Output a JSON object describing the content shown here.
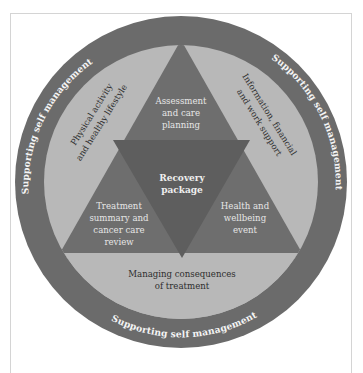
{
  "diagram": {
    "colors": {
      "outer_ring": "#6b6b6b",
      "inner_band": "#b8b8b8",
      "upward_triangle": "#6e6e6e",
      "inverted_triangle": "#5e5e5e",
      "ring_text": "#f4f4f4",
      "band_text": "#2e2e2e",
      "triangle_text": "#e6e6e6",
      "frame_border": "#d4d4d4"
    },
    "outer_ring": {
      "label_top_left": "Supporting self management",
      "label_top_right": "Supporting self management",
      "label_bottom": "Supporting self management"
    },
    "inner_band": {
      "left": [
        "Physical activity",
        "and healthy lifestyle"
      ],
      "right": [
        "Information, financial",
        "and work support"
      ],
      "bottom": [
        "Managing consequences",
        "of treatment"
      ]
    },
    "triangle_segments": {
      "top": [
        "Assessment",
        "and care",
        "planning"
      ],
      "bottom_left": [
        "Treatment",
        "summary and",
        "cancer care",
        "review"
      ],
      "bottom_right": [
        "Health and",
        "wellbeing",
        "event"
      ]
    },
    "center": {
      "label": [
        "Recovery",
        "package"
      ]
    }
  }
}
